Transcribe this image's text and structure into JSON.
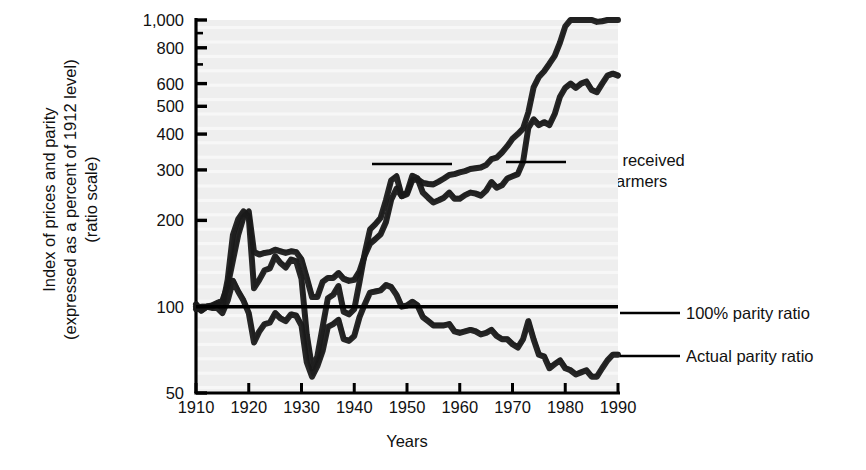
{
  "chart_data": {
    "type": "line",
    "title": "",
    "xlabel": "Years",
    "ylabel_lines": [
      "Index of prices and parity",
      "(expressed as a percent of 1912 level)",
      "(ratio scale)"
    ],
    "scale": "log",
    "ylim": [
      50,
      1000
    ],
    "xlim": [
      1910,
      1990
    ],
    "grid": false,
    "yticks": [
      50,
      100,
      200,
      300,
      400,
      500,
      600,
      800,
      1000
    ],
    "ytick_labels": [
      "50",
      "100",
      "200",
      "300",
      "400",
      "500",
      "600",
      "800",
      "1,000"
    ],
    "yminor_ticks": [
      700,
      900
    ],
    "xticks": [
      1910,
      1920,
      1930,
      1940,
      1950,
      1960,
      1970,
      1980,
      1990
    ],
    "xtick_labels": [
      "1910",
      "1920",
      "1930",
      "1940",
      "1950",
      "1960",
      "1970",
      "1980",
      "1990"
    ],
    "legend_position": "inline-annotations",
    "annotations": [
      {
        "id": "prices-paid",
        "lines": [
          "Prices paid",
          "by farmers"
        ],
        "x": 1910,
        "y": 400
      },
      {
        "id": "prices-received",
        "lines": [
          "Prices received",
          "by farmers"
        ],
        "x": 1973,
        "y": 330
      },
      {
        "id": "parity-100",
        "lines": [
          "100% parity ratio"
        ],
        "x": 1993,
        "y": 100
      },
      {
        "id": "parity-actual",
        "lines": [
          "Actual parity ratio"
        ],
        "x": 1993,
        "y": 68
      }
    ],
    "series": [
      {
        "name": "Prices paid by farmers",
        "color": "#1a1a1a",
        "x": [
          1910,
          1911,
          1912,
          1913,
          1914,
          1915,
          1916,
          1917,
          1918,
          1919,
          1920,
          1921,
          1922,
          1923,
          1924,
          1925,
          1926,
          1927,
          1928,
          1929,
          1930,
          1931,
          1932,
          1933,
          1934,
          1935,
          1936,
          1937,
          1938,
          1939,
          1940,
          1941,
          1942,
          1943,
          1944,
          1945,
          1946,
          1947,
          1948,
          1949,
          1950,
          1951,
          1952,
          1953,
          1954,
          1955,
          1956,
          1957,
          1958,
          1959,
          1960,
          1961,
          1962,
          1963,
          1964,
          1965,
          1966,
          1967,
          1968,
          1969,
          1970,
          1971,
          1972,
          1973,
          1974,
          1975,
          1976,
          1977,
          1978,
          1979,
          1980,
          1981,
          1982,
          1983,
          1984,
          1985,
          1986,
          1987,
          1988,
          1989,
          1990
        ],
        "values": [
          98,
          100,
          100,
          101,
          103,
          105,
          118,
          145,
          178,
          205,
          215,
          155,
          152,
          154,
          155,
          158,
          156,
          154,
          156,
          155,
          146,
          126,
          108,
          108,
          122,
          126,
          126,
          131,
          125,
          123,
          124,
          133,
          151,
          166,
          172,
          179,
          197,
          236,
          258,
          243,
          247,
          276,
          278,
          270,
          268,
          267,
          273,
          280,
          288,
          290,
          294,
          297,
          302,
          304,
          306,
          312,
          327,
          331,
          345,
          363,
          385,
          400,
          418,
          476,
          582,
          633,
          663,
          704,
          750,
          834,
          950,
          1002,
          1010,
          1005,
          1020,
          1005,
          985,
          990,
          1010,
          1020,
          1030
        ],
        "note": "Index of prices paid by farmers, 1912 = 100, ratio (log) scale"
      },
      {
        "name": "Prices received by farmers",
        "color": "#1a1a1a",
        "x": [
          1910,
          1911,
          1912,
          1913,
          1914,
          1915,
          1916,
          1917,
          1918,
          1919,
          1920,
          1921,
          1922,
          1923,
          1924,
          1925,
          1926,
          1927,
          1928,
          1929,
          1930,
          1931,
          1932,
          1933,
          1934,
          1935,
          1936,
          1937,
          1938,
          1939,
          1940,
          1941,
          1942,
          1943,
          1944,
          1945,
          1946,
          1947,
          1948,
          1949,
          1950,
          1951,
          1952,
          1953,
          1954,
          1955,
          1956,
          1957,
          1958,
          1959,
          1960,
          1961,
          1962,
          1963,
          1964,
          1965,
          1966,
          1967,
          1968,
          1969,
          1970,
          1971,
          1972,
          1973,
          1974,
          1975,
          1976,
          1977,
          1978,
          1979,
          1980,
          1981,
          1982,
          1983,
          1984,
          1985,
          1986,
          1987,
          1988,
          1989,
          1990
        ],
        "values": [
          100,
          97,
          100,
          100,
          102,
          100,
          124,
          178,
          202,
          215,
          205,
          116,
          124,
          134,
          136,
          150,
          142,
          137,
          146,
          144,
          125,
          80,
          61,
          67,
          85,
          107,
          110,
          118,
          96,
          94,
          98,
          122,
          154,
          186,
          194,
          204,
          235,
          276,
          285,
          243,
          250,
          286,
          280,
          250,
          240,
          231,
          235,
          240,
          250,
          238,
          238,
          245,
          250,
          248,
          244,
          254,
          272,
          260,
          265,
          280,
          285,
          290,
          320,
          420,
          450,
          430,
          440,
          430,
          470,
          540,
          580,
          600,
          580,
          600,
          610,
          570,
          560,
          600,
          640,
          650,
          640
        ],
        "note": "Index of prices received by farmers, 1912 = 100, ratio (log) scale"
      },
      {
        "name": "Actual parity ratio",
        "color": "#1a1a1a",
        "x": [
          1910,
          1911,
          1912,
          1913,
          1914,
          1915,
          1916,
          1917,
          1918,
          1919,
          1920,
          1921,
          1922,
          1923,
          1924,
          1925,
          1926,
          1927,
          1928,
          1929,
          1930,
          1931,
          1932,
          1933,
          1934,
          1935,
          1936,
          1937,
          1938,
          1939,
          1940,
          1941,
          1942,
          1943,
          1944,
          1945,
          1946,
          1947,
          1948,
          1949,
          1950,
          1951,
          1952,
          1953,
          1954,
          1955,
          1956,
          1957,
          1958,
          1959,
          1960,
          1961,
          1962,
          1963,
          1964,
          1965,
          1966,
          1967,
          1968,
          1969,
          1970,
          1971,
          1972,
          1973,
          1974,
          1975,
          1976,
          1977,
          1978,
          1979,
          1980,
          1981,
          1982,
          1983,
          1984,
          1985,
          1986,
          1987,
          1988,
          1989,
          1990
        ],
        "values": [
          102,
          97,
          100,
          99,
          99,
          95,
          105,
          123,
          113,
          105,
          95,
          75,
          82,
          87,
          88,
          95,
          91,
          89,
          94,
          93,
          86,
          64,
          57,
          62,
          70,
          85,
          87,
          90,
          77,
          76,
          79,
          92,
          102,
          112,
          113,
          114,
          119,
          117,
          110,
          100,
          101,
          104,
          101,
          92,
          89,
          86,
          86,
          86,
          87,
          82,
          81,
          82,
          83,
          82,
          80,
          81,
          83,
          79,
          77,
          77,
          74,
          72,
          77,
          89,
          77,
          68,
          67,
          61,
          63,
          65,
          61,
          60,
          58,
          59,
          60,
          57,
          57,
          61,
          65,
          68,
          68
        ],
        "note": "Actual parity ratio (prices received / prices paid), percent; straight line at 100 denotes 100% parity"
      },
      {
        "name": "100% parity ratio",
        "color": "#000000",
        "x": [
          1910,
          1990
        ],
        "values": [
          100,
          100
        ],
        "style": "straight-reference-line"
      }
    ]
  },
  "axes": {
    "xlabel": "Years",
    "ylabel_line1": "Index of prices and parity",
    "ylabel_line2": "(expressed as a percent of 1912 level)",
    "ylabel_line3": "(ratio scale)"
  },
  "annotations": {
    "prices_paid_line1": "Prices paid",
    "prices_paid_line2": "by farmers",
    "prices_received_line1": "Prices received",
    "prices_received_line2": "by farmers",
    "parity_100": "100% parity ratio",
    "parity_actual": "Actual parity ratio"
  },
  "colors": {
    "plot_background": "#eeeeee",
    "line": "#1a1a1a",
    "axis": "#000000",
    "page_background": "#ffffff"
  }
}
